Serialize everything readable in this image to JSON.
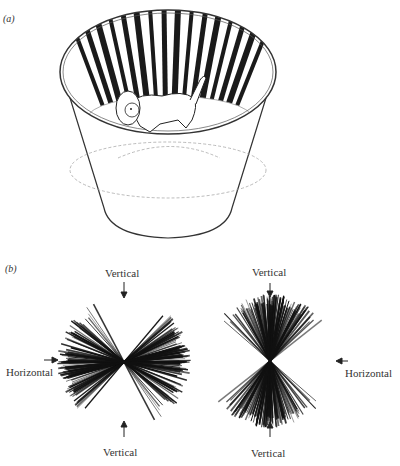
{
  "panel_a": {
    "label": "(a)",
    "description": "Kitten inside a cylinder lined with vertical black-and-white stripes",
    "stripe_color": "#1a1a1a",
    "outline_color": "#333333"
  },
  "panel_b": {
    "label": "(b)",
    "left_plot": {
      "top_label": "Vertical",
      "bottom_label": "Vertical",
      "side_label": "Horizontal",
      "side_position": "left",
      "dominant_orientation": "horizontal"
    },
    "right_plot": {
      "top_label": "Vertical",
      "bottom_label": "Vertical",
      "side_label": "Horizontal",
      "side_position": "right",
      "dominant_orientation": "vertical"
    }
  }
}
